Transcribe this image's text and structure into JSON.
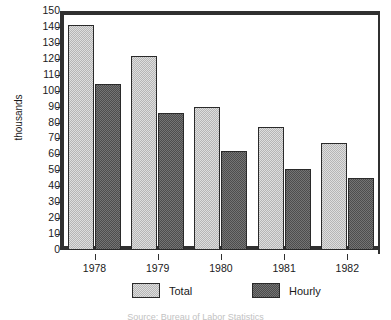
{
  "chart_data": {
    "type": "bar",
    "title": "",
    "subtitle": "",
    "xlabel": "",
    "ylabel": "thousands",
    "categories": [
      "1978",
      "1979",
      "1980",
      "1981",
      "1982"
    ],
    "series": [
      {
        "name": "Total",
        "color": "#b6b6b6",
        "values": [
          141,
          122,
          90,
          77,
          67
        ]
      },
      {
        "name": "Hourly",
        "color": "#4d4d4d",
        "values": [
          104,
          86,
          62,
          51,
          45
        ]
      }
    ],
    "ylim": [
      0,
      150
    ],
    "ytick_step": 10,
    "yticks": [
      "150",
      "140",
      "130",
      "120",
      "110",
      "100",
      "90",
      "80",
      "70",
      "60",
      "50",
      "40",
      "30",
      "20",
      "10",
      "0"
    ],
    "grid": false,
    "legend_position": "bottom",
    "caption": "Source: Bureau of Labor Statistics"
  },
  "axes": {
    "y_label": "thousands",
    "y_ticks": [
      "150",
      "140",
      "130",
      "120",
      "110",
      "100",
      "90",
      "80",
      "70",
      "60",
      "50",
      "40",
      "30",
      "20",
      "10",
      "0"
    ],
    "x_ticks": [
      "1978",
      "1979",
      "1980",
      "1981",
      "1982"
    ]
  },
  "legend": {
    "items": [
      {
        "label": "Total",
        "swatch": "light-gray-hatch"
      },
      {
        "label": "Hourly",
        "swatch": "dark-gray-hatch"
      }
    ]
  },
  "title_cut": "",
  "caption_cut": "Source: Bureau of Labor Statistics"
}
